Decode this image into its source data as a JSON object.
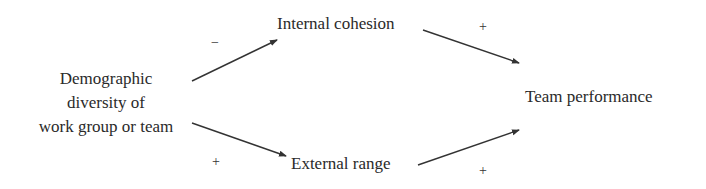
{
  "diagram": {
    "type": "causal-path-diagram",
    "nodes": [
      {
        "id": "diversity",
        "lines": [
          "Demographic",
          "diversity of",
          "work group or team"
        ]
      },
      {
        "id": "cohesion",
        "label": "Internal cohesion"
      },
      {
        "id": "range",
        "label": "External range"
      },
      {
        "id": "performance",
        "label": "Team performance"
      }
    ],
    "edges": [
      {
        "from": "diversity",
        "to": "cohesion",
        "sign": "−"
      },
      {
        "from": "cohesion",
        "to": "performance",
        "sign": "+"
      },
      {
        "from": "diversity",
        "to": "range",
        "sign": "+"
      },
      {
        "from": "range",
        "to": "performance",
        "sign": "+"
      }
    ],
    "colors": {
      "text": "#2a2a2a",
      "arrow": "#333333",
      "background": "#ffffff"
    }
  }
}
